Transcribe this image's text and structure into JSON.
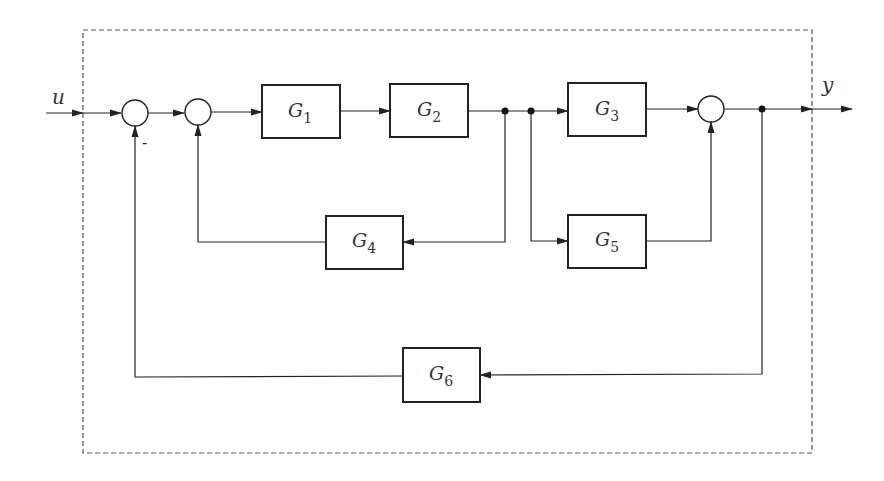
{
  "diagram": {
    "type": "block-diagram",
    "colors": {
      "line": "#222222",
      "border": "#555555",
      "text": "#333333",
      "background": "#ffffff"
    },
    "boundary": {
      "style": "dashed"
    },
    "signals": {
      "input": "u",
      "output": "y"
    },
    "sum_signs": {
      "sum1_feedback": "-"
    },
    "blocks": [
      {
        "id": "G1",
        "base": "G",
        "sub": "1"
      },
      {
        "id": "G2",
        "base": "G",
        "sub": "2"
      },
      {
        "id": "G3",
        "base": "G",
        "sub": "3"
      },
      {
        "id": "G4",
        "base": "G",
        "sub": "4"
      },
      {
        "id": "G5",
        "base": "G",
        "sub": "5"
      },
      {
        "id": "G6",
        "base": "G",
        "sub": "6"
      }
    ],
    "summing_junctions": [
      "sum1",
      "sum2",
      "sum3"
    ],
    "connections": [
      "u -> sum1",
      "sum1 -> sum2",
      "sum2 -> G1",
      "G1 -> G2",
      "G2 -> G3",
      "G2 -> G4 -> sum2",
      "G2 -> G5 -> sum3",
      "G3 -> sum3",
      "sum3 -> y",
      "y -> G6 -> sum1 (-)"
    ]
  }
}
